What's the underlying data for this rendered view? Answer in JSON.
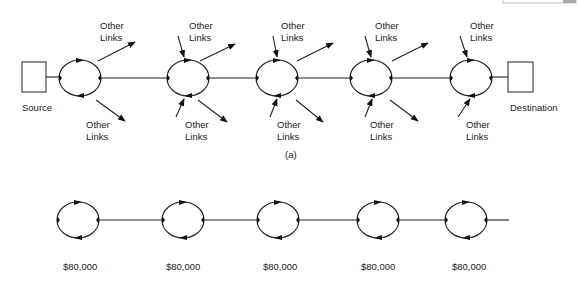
{
  "diagram": {
    "part_a": {
      "caption": "(a)",
      "source_label": "Source",
      "destination_label": "Destination",
      "other_links_label_line1": "Other",
      "other_links_label_line2": "Links",
      "nodes": [
        {
          "id": "ring-1",
          "cx": 80,
          "cy": 78
        },
        {
          "id": "ring-2",
          "cx": 188,
          "cy": 78
        },
        {
          "id": "ring-3",
          "cx": 277,
          "cy": 78
        },
        {
          "id": "ring-4",
          "cx": 371,
          "cy": 78
        },
        {
          "id": "ring-5",
          "cx": 471,
          "cy": 78
        }
      ]
    },
    "part_b": {
      "nodes": [
        {
          "id": "ring-1",
          "cx": 78,
          "cy": 220,
          "cost": "$80,000"
        },
        {
          "id": "ring-2",
          "cx": 183,
          "cy": 220,
          "cost": "$80,000"
        },
        {
          "id": "ring-3",
          "cx": 278,
          "cy": 220,
          "cost": "$80,000"
        },
        {
          "id": "ring-4",
          "cx": 378,
          "cy": 220,
          "cost": "$80,000"
        },
        {
          "id": "ring-5",
          "cx": 466,
          "cy": 220,
          "cost": "$80,000"
        }
      ]
    }
  }
}
